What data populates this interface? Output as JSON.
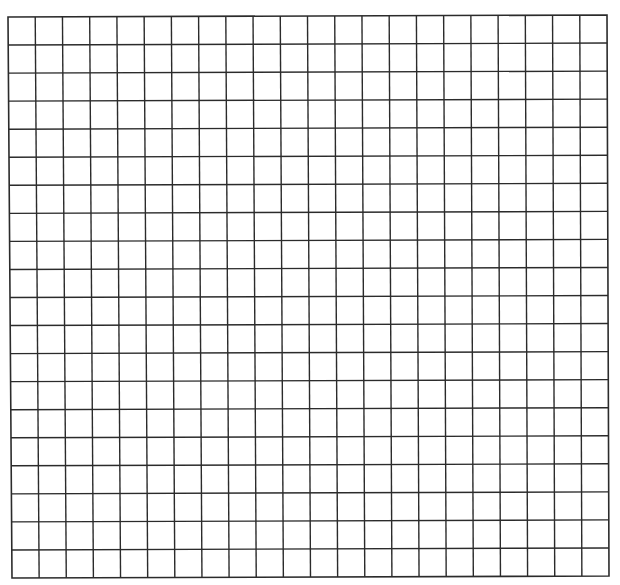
{
  "page": {
    "background": "#ffffff",
    "line_color": "#2b2b2b"
  },
  "grid": {
    "columns": 22,
    "rows": 20,
    "corners": {
      "top_left": [
        8,
        17
      ],
      "top_right": [
        607,
        15
      ],
      "bottom_left": [
        12,
        578
      ],
      "bottom_right": [
        609,
        576
      ]
    }
  }
}
